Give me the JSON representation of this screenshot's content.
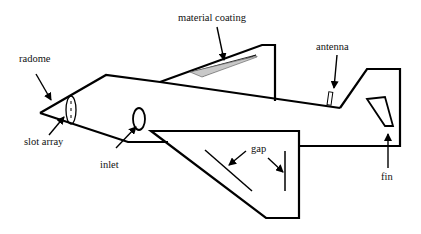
{
  "diagram": {
    "labels": {
      "radome": "radome",
      "material_coating": "material coating",
      "antenna": "antenna",
      "slot_array": "slot array",
      "inlet": "inlet",
      "gap": "gap",
      "fin": "fin"
    },
    "colors": {
      "stroke": "#000000",
      "coating_fill": "#c8c8c8",
      "background": "#ffffff"
    }
  }
}
